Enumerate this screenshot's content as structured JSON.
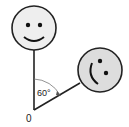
{
  "diagram": {
    "origin_label": "0",
    "angle_label": "60°",
    "faces": [
      {
        "name": "upright-smiley",
        "fill": "#eeeeee"
      },
      {
        "name": "rotated-smiley",
        "fill": "#dddddd"
      }
    ],
    "stroke_color": "#222222"
  }
}
